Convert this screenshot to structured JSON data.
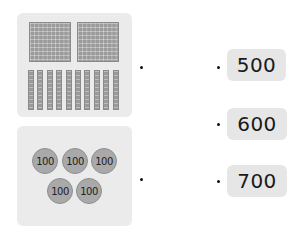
{
  "question_cards": [
    {
      "id": "blocks-card",
      "description": "2 hundred-squares and 10 ten-rods",
      "hundred_squares": 2,
      "ten_rods": 10
    },
    {
      "id": "coins-card",
      "description": "5 coins labeled 100",
      "coins": [
        "100",
        "100",
        "100",
        "100",
        "100"
      ]
    }
  ],
  "answers": [
    {
      "label": "500"
    },
    {
      "label": "600"
    },
    {
      "label": "700"
    }
  ],
  "colors": {
    "card_bg": "#ebebeb",
    "block_fill": "#9a9a9a",
    "coin_fill": "#a9a9a9",
    "answer_bg": "#e6e6e6"
  }
}
